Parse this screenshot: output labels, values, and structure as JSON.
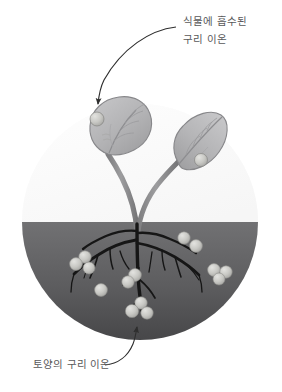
{
  "diagram": {
    "title_absent": true,
    "labels": {
      "plant_uptake": {
        "line1": "식물에 흡수된",
        "line2": "구리 이온",
        "name": "plant-absorbed-copper-ion-label"
      },
      "soil_ions": {
        "line1": "토양의 구리 이온",
        "name": "soil-copper-ion-label"
      }
    },
    "colors": {
      "background": "#ffffff",
      "air_circle": "#fbfbfb",
      "soil_top": "#6e6e70",
      "soil_bottom": "#4a4a4c",
      "root": "#1b1b1b",
      "stem": "#8d8d8f",
      "leaf_fill": "#b7b7b9",
      "leaf_edge": "#7e7e80",
      "ion_fill": "#c9c9c6",
      "ion_edge": "#9a9a97",
      "text": "#58585a",
      "arrow": "#2e2e2e"
    },
    "geometry": {
      "circle_center_x": 140,
      "circle_center_y": 222,
      "circle_radius": 118,
      "soil_line_y": 222
    },
    "elements": {
      "air_region": "air-region",
      "soil_region": "soil-region",
      "left_leaf": "left-leaf",
      "right_leaf": "right-leaf",
      "stem": "plant-stem",
      "root_system": "root-system"
    },
    "ions": {
      "leaf_count": 2,
      "soil_count": 14,
      "leaf_positions": [
        {
          "x": 97,
          "y": 119,
          "r": 7.0
        },
        {
          "x": 201,
          "y": 160,
          "r": 6.5
        }
      ],
      "soil_positions": [
        {
          "x": 184,
          "y": 238,
          "r": 6.2
        },
        {
          "x": 196,
          "y": 246,
          "r": 6.4
        },
        {
          "x": 85,
          "y": 257,
          "r": 6.2
        },
        {
          "x": 76,
          "y": 264,
          "r": 6.4
        },
        {
          "x": 89,
          "y": 268,
          "r": 6.0
        },
        {
          "x": 214,
          "y": 270,
          "r": 6.4
        },
        {
          "x": 226,
          "y": 272,
          "r": 6.2
        },
        {
          "x": 219,
          "y": 279,
          "r": 6.0
        },
        {
          "x": 135,
          "y": 275,
          "r": 6.4
        },
        {
          "x": 128,
          "y": 282,
          "r": 6.2
        },
        {
          "x": 101,
          "y": 290,
          "r": 6.4
        },
        {
          "x": 141,
          "y": 303,
          "r": 6.2
        },
        {
          "x": 132,
          "y": 311,
          "r": 6.6
        },
        {
          "x": 147,
          "y": 313,
          "r": 6.2
        }
      ]
    },
    "arrows": {
      "top": {
        "name": "plant-uptake-arrow",
        "from": "label",
        "to": "left-leaf-ion"
      },
      "bottom": {
        "name": "soil-ion-arrow",
        "from": "label",
        "to": "soil-ion-cluster"
      }
    }
  }
}
